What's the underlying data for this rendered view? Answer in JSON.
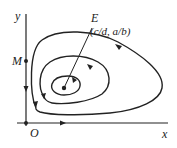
{
  "diagram": {
    "type": "phase-portrait",
    "axes": {
      "x_label": "x",
      "y_label": "y",
      "origin_label": "O"
    },
    "points": [
      {
        "id": "E",
        "label": "E",
        "coords_label": "(c/d, a/b)"
      },
      {
        "id": "M",
        "label": "M"
      }
    ],
    "colors": {
      "stroke": "#222222",
      "background": "#ffffff"
    }
  }
}
